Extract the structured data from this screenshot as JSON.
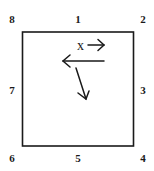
{
  "diagram": {
    "box": {
      "x": 22,
      "y": 32,
      "width": 112,
      "height": 114,
      "stroke": "#1a1a1a"
    },
    "corner_labels": [
      {
        "text": "8",
        "x": 12,
        "y": 23
      },
      {
        "text": "1",
        "x": 78,
        "y": 23
      },
      {
        "text": "2",
        "x": 143,
        "y": 23
      },
      {
        "text": "7",
        "x": 12,
        "y": 94
      },
      {
        "text": "3",
        "x": 143,
        "y": 94
      },
      {
        "text": "6",
        "x": 12,
        "y": 162
      },
      {
        "text": "5",
        "x": 78,
        "y": 162
      },
      {
        "text": "4",
        "x": 143,
        "y": 162
      }
    ],
    "x_label": "x",
    "arrows": [
      {
        "name": "small-right-arrow",
        "direction": "right"
      },
      {
        "name": "left-arrow",
        "direction": "left"
      },
      {
        "name": "down-diagonal-arrow",
        "direction": "down-right"
      }
    ]
  }
}
